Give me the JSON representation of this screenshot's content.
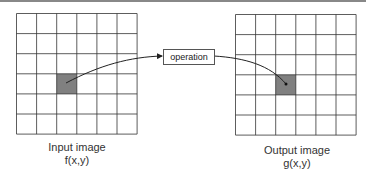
{
  "diagram": {
    "operation_label": "operation",
    "input": {
      "title": "Input image",
      "func": "f(x,y)",
      "grid_size": 6,
      "highlight_cell": [
        2,
        3
      ]
    },
    "output": {
      "title": "Output image",
      "func": "g(x,y)",
      "grid_size": 6,
      "highlight_cell": [
        2,
        3
      ]
    },
    "colors": {
      "grid_line": "#333333",
      "highlight": "#808080",
      "arrow": "#222222"
    }
  }
}
